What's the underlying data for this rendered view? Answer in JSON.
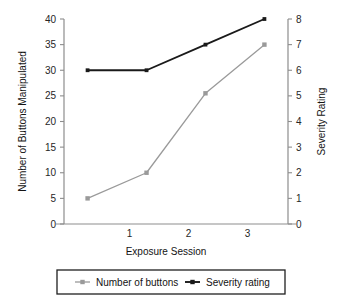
{
  "chart_data": {
    "type": "line",
    "title": "",
    "subtitle": "",
    "xlabel": "Exposure Session",
    "ylabel": "Number of Buttons Manipulated",
    "y2label": "Severity Rating",
    "x": [
      1,
      2,
      3,
      4
    ],
    "categories": [
      "1",
      "2",
      "3",
      "4"
    ],
    "xtick_labels": [
      "1",
      "2",
      "3"
    ],
    "xtick_values": [
      2,
      3,
      4
    ],
    "xlim": [
      0.6,
      4.4
    ],
    "ylim": [
      0,
      40
    ],
    "y2lim": [
      0,
      8
    ],
    "ytick_labels": [
      "0",
      "5",
      "10",
      "15",
      "20",
      "25",
      "30",
      "35",
      "40"
    ],
    "ytick_values": [
      0,
      5,
      10,
      15,
      20,
      25,
      30,
      35,
      40
    ],
    "y2tick_labels": [
      "0",
      "1",
      "2",
      "3",
      "4",
      "5",
      "6",
      "7",
      "8"
    ],
    "y2tick_values": [
      0,
      1,
      2,
      3,
      4,
      5,
      6,
      7,
      8
    ],
    "grid": false,
    "legend_position": "bottom",
    "series": [
      {
        "name": "Number of buttons",
        "axis": "left",
        "color": "#9a9a9a",
        "marker": "square",
        "values": [
          5,
          10,
          25.5,
          35
        ]
      },
      {
        "name": "Severity rating",
        "axis": "right",
        "color": "#1a1a1a",
        "marker": "square",
        "values": [
          6,
          6,
          7,
          8
        ]
      }
    ]
  },
  "legend": {
    "items": [
      {
        "label": "Number of buttons",
        "color": "#9a9a9a"
      },
      {
        "label": "Severity rating",
        "color": "#1a1a1a"
      }
    ]
  },
  "colors": {
    "background": "#ffffff",
    "axis": "#8d8d8d",
    "text": "#131313",
    "series_gray": "#9a9a9a",
    "series_black": "#1a1a1a",
    "legend_border": "#1f1f1f"
  }
}
